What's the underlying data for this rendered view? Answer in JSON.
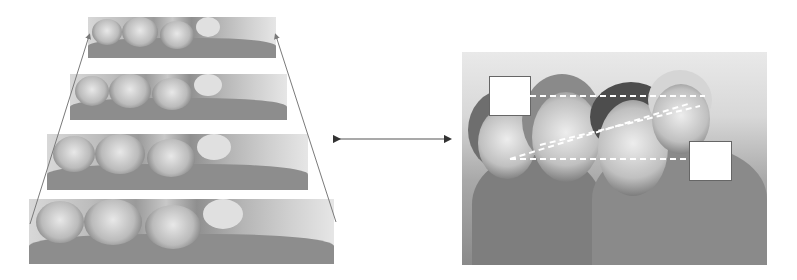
{
  "figure": {
    "left_panel": {
      "description": "Stack of four perspective-scaled copies of the family photo forming a trapezoid pyramid",
      "strips": [
        {
          "left": 88,
          "top": 17,
          "width": 188,
          "height": 41
        },
        {
          "left": 70,
          "top": 74,
          "width": 217,
          "height": 46
        },
        {
          "left": 47,
          "top": 134,
          "width": 261,
          "height": 56
        },
        {
          "left": 29,
          "top": 199,
          "width": 305,
          "height": 65
        }
      ],
      "arrow_color": "#7a7a7a"
    },
    "connector": {
      "type": "double-arrow",
      "color": "#333333"
    },
    "right_panel": {
      "description": "Family photo with two white occlusion squares and dashed white alignment lines",
      "occlusion_boxes": 2,
      "dashed_line_color": "#ffffff"
    }
  }
}
